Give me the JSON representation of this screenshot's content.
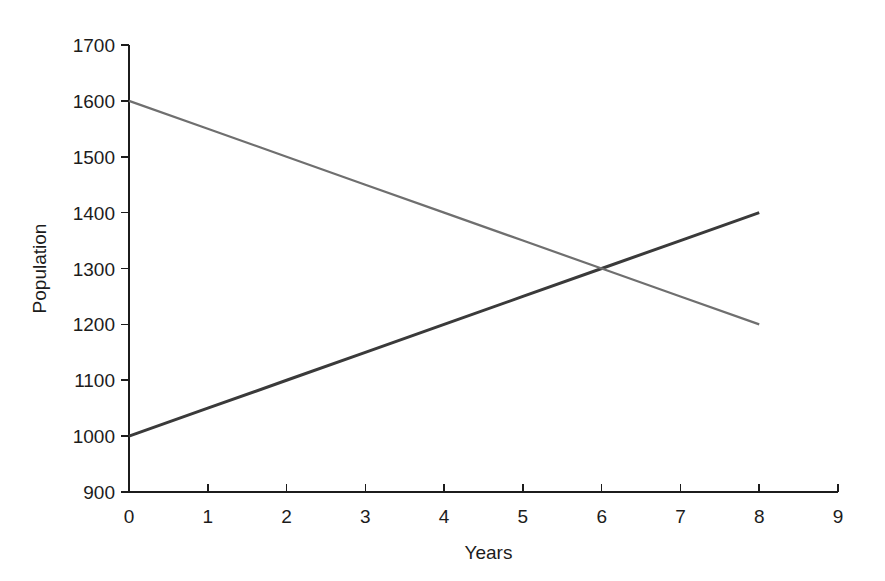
{
  "chart_data": {
    "type": "line",
    "title": "",
    "xlabel": "Years",
    "ylabel": "Population",
    "xlim": [
      0,
      9
    ],
    "ylim": [
      900,
      1700
    ],
    "x_ticks": [
      0,
      1,
      2,
      3,
      4,
      5,
      6,
      7,
      8,
      9
    ],
    "y_ticks": [
      900,
      1000,
      1100,
      1200,
      1300,
      1400,
      1500,
      1600,
      1700
    ],
    "x_tick_labels": [
      "0",
      "1",
      "2",
      "3",
      "4",
      "5",
      "6",
      "7",
      "8",
      "9"
    ],
    "y_tick_labels": [
      "900",
      "1000",
      "1100",
      "1200",
      "1300",
      "1400",
      "1500",
      "1600",
      "1700"
    ],
    "grid": false,
    "legend": "none",
    "x": [
      0,
      1,
      2,
      3,
      4,
      5,
      6,
      7,
      8
    ],
    "series": [
      {
        "name": "increasing-population",
        "color": "#3a3a3a",
        "width": 3.0,
        "values": [
          1000,
          1050,
          1100,
          1150,
          1200,
          1250,
          1300,
          1350,
          1400
        ]
      },
      {
        "name": "decreasing-population",
        "color": "#6f6f6f",
        "width": 2.2,
        "values": [
          1600,
          1550,
          1500,
          1450,
          1400,
          1350,
          1300,
          1250,
          1200
        ]
      }
    ],
    "intersection": {
      "x": 6,
      "y": 1300
    }
  },
  "axes": {
    "x_axis_name": "x-axis",
    "y_axis_name": "y-axis"
  }
}
